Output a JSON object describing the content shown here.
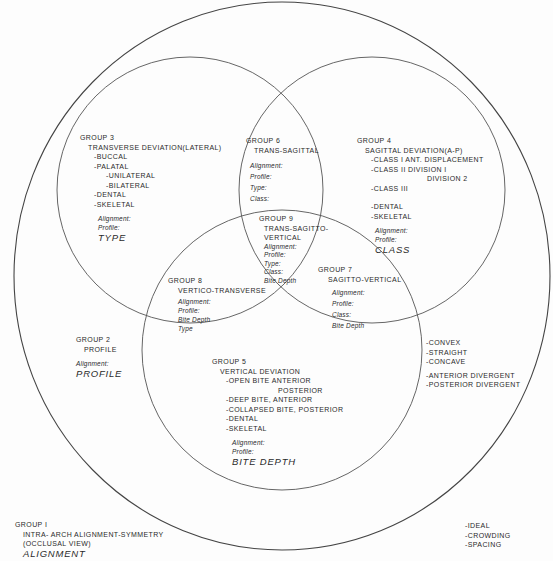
{
  "diagram": {
    "colors": {
      "line": "#444444",
      "text": "#2a2a2a",
      "background": "#fdfdfd"
    },
    "circles": {
      "outer": {
        "label": "Group 1",
        "cx": 282,
        "cy": 276,
        "rx": 268,
        "ry": 274
      },
      "transverse": {
        "label": "Group 3",
        "cx": 190,
        "cy": 190,
        "r": 133
      },
      "sagittal": {
        "label": "Group 4",
        "cx": 372,
        "cy": 190,
        "r": 133
      },
      "vertical": {
        "label": "Group 5",
        "cx": 282,
        "cy": 350,
        "r": 140
      }
    },
    "group1": {
      "title": "GROUP I",
      "lines": [
        "INTRA- ARCH ALIGNMENT-SYMMETRY",
        "(OCCLUSAL VIEW)"
      ],
      "big": "ALIGNMENT",
      "side_list": [
        "-IDEAL",
        "-CROWDING",
        "-SPACING"
      ]
    },
    "group2": {
      "title": "GROUP 2",
      "subtitle": "PROFILE",
      "fields": [
        "Alignment:"
      ],
      "big": "PROFILE",
      "side_list_a": [
        "-CONVEX",
        "-STRAIGHT",
        "-CONCAVE"
      ],
      "side_list_b": [
        "-ANTERIOR DIVERGENT",
        "-POSTERIOR DIVERGENT"
      ]
    },
    "group3": {
      "title": "GROUP 3",
      "subtitle": "TRANSVERSE DEVIATION(LATERAL)",
      "items": [
        "-BUCCAL",
        "-PALATAL"
      ],
      "subitems": [
        "-UNILATERAL",
        "-BILATERAL"
      ],
      "items2": [
        "-DENTAL",
        "-SKELETAL"
      ],
      "fields": [
        "Alignment:",
        "Profile:"
      ],
      "big": "TYPE"
    },
    "group4": {
      "title": "GROUP 4",
      "subtitle": "SAGITTAL DEVIATION(A-P)",
      "class1": "-CLASS I  ANT. DISPLACEMENT",
      "class2": "-CLASS II  DIVISION I",
      "class2b": "DIVISION 2",
      "class3": "-CLASS III",
      "items2": [
        "-DENTAL",
        "-SKELETAL"
      ],
      "fields": [
        "Alignment:",
        "Profile:"
      ],
      "big": "CLASS"
    },
    "group5": {
      "title": "GROUP 5",
      "subtitle": "VERTICAL DEVIATION",
      "open_bite": "-OPEN BITE  ANTERIOR",
      "open_bite_b": "POSTERIOR",
      "items": [
        "-DEEP BITE, ANTERIOR",
        "-COLLAPSED BITE, POSTERIOR",
        "-DENTAL",
        "-SKELETAL"
      ],
      "fields": [
        "Alignment:",
        "Profile:"
      ],
      "big": "BITE DEPTH"
    },
    "group6": {
      "title": "GROUP 6",
      "subtitle": "TRANS-SAGITTAL",
      "fields": [
        "Alignment:",
        "Profile:",
        "Type:",
        "Class:"
      ]
    },
    "group7": {
      "title": "GROUP 7",
      "subtitle": "SAGITTO-VERTICAL",
      "fields": [
        "Alignment:",
        "Profile:",
        "Class:",
        "Bite Depth"
      ]
    },
    "group8": {
      "title": "GROUP 8",
      "subtitle": "VERTICO-TRANSVERSE",
      "fields": [
        "Alignment:",
        "Profile:",
        "Bite Depth",
        "Type"
      ]
    },
    "group9": {
      "title": "GROUP 9",
      "subtitle": [
        "TRANS-SAGITTO-",
        "VERTICAL"
      ],
      "fields": [
        "Alignment:",
        "Profile:",
        "Type:",
        "Class:",
        "Bite Depth"
      ]
    }
  }
}
